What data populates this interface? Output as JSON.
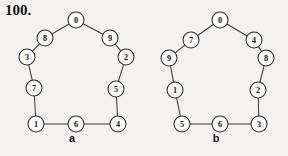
{
  "problem": {
    "number": "100."
  },
  "figures": [
    {
      "id": "a",
      "caption": "a",
      "layout": "decagon-cycle",
      "node_radius": 8,
      "center": {
        "x": 76,
        "y": 72
      },
      "ring_radius": 54,
      "nodes": [
        {
          "label": "0",
          "x": 76,
          "y": 20
        },
        {
          "label": "9",
          "x": 110,
          "y": 38
        },
        {
          "label": "2",
          "x": 126,
          "y": 57
        },
        {
          "label": "5",
          "x": 116,
          "y": 89
        },
        {
          "label": "4",
          "x": 118,
          "y": 124
        },
        {
          "label": "6",
          "x": 76,
          "y": 124
        },
        {
          "label": "1",
          "x": 36,
          "y": 124
        },
        {
          "label": "7",
          "x": 34,
          "y": 88
        },
        {
          "label": "3",
          "x": 27,
          "y": 57
        },
        {
          "label": "8",
          "x": 45,
          "y": 38
        }
      ],
      "edges": [
        [
          "0",
          "9"
        ],
        [
          "9",
          "2"
        ],
        [
          "2",
          "5"
        ],
        [
          "5",
          "4"
        ],
        [
          "4",
          "6"
        ],
        [
          "6",
          "1"
        ],
        [
          "1",
          "7"
        ],
        [
          "7",
          "3"
        ],
        [
          "3",
          "8"
        ],
        [
          "8",
          "0"
        ]
      ]
    },
    {
      "id": "b",
      "caption": "b",
      "layout": "decagon-cycle",
      "node_radius": 8,
      "center": {
        "x": 72,
        "y": 72
      },
      "ring_radius": 54,
      "nodes": [
        {
          "label": "0",
          "x": 76,
          "y": 20
        },
        {
          "label": "4",
          "x": 110,
          "y": 40
        },
        {
          "label": "8",
          "x": 122,
          "y": 58
        },
        {
          "label": "2",
          "x": 114,
          "y": 90
        },
        {
          "label": "3",
          "x": 115,
          "y": 124
        },
        {
          "label": "6",
          "x": 76,
          "y": 124
        },
        {
          "label": "5",
          "x": 38,
          "y": 124
        },
        {
          "label": "1",
          "x": 31,
          "y": 90
        },
        {
          "label": "9",
          "x": 25,
          "y": 58
        },
        {
          "label": "7",
          "x": 47,
          "y": 40
        }
      ],
      "edges": [
        [
          "0",
          "4"
        ],
        [
          "4",
          "8"
        ],
        [
          "8",
          "2"
        ],
        [
          "2",
          "3"
        ],
        [
          "3",
          "6"
        ],
        [
          "6",
          "5"
        ],
        [
          "5",
          "1"
        ],
        [
          "1",
          "9"
        ],
        [
          "9",
          "7"
        ],
        [
          "7",
          "0"
        ]
      ]
    }
  ],
  "colors": {
    "background": "#f3f2f0",
    "stroke": "#2c2c2c",
    "node_fill": "#fbfbfa",
    "text": "#141414"
  }
}
